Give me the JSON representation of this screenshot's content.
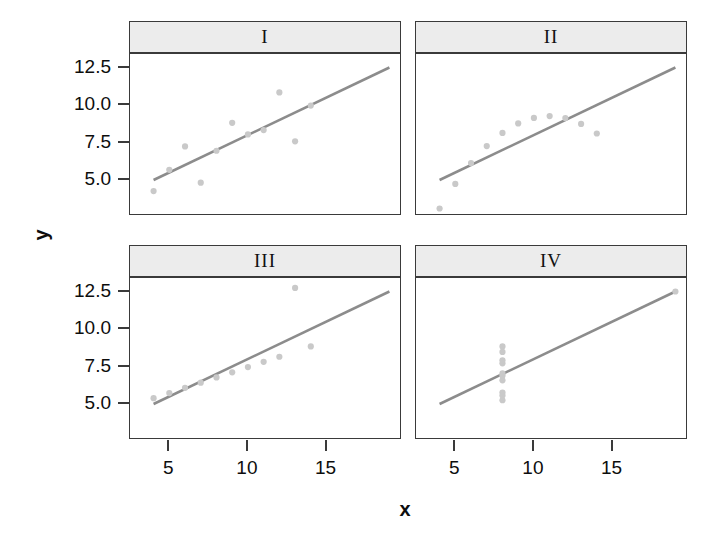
{
  "figure": {
    "width": 720,
    "height": 550,
    "background": "#ffffff",
    "xlabel": "x",
    "ylabel": "y",
    "point_color": "#c9c9c9",
    "line_color": "#8c8c8c",
    "border_color": "#3a3a3a",
    "strip_color": "#ececec",
    "text_color": "#0d0d0d"
  },
  "chart_data": {
    "type": "scatter",
    "title": "",
    "xlabel": "x",
    "ylabel": "y",
    "grid": false,
    "legend": "none",
    "layout": "2x2 trellis panels",
    "xlim": [
      2.5,
      19.8
    ],
    "ylim": [
      2.6,
      13.4
    ],
    "xticks": [
      5,
      10,
      15
    ],
    "xticklabels": [
      "5",
      "10",
      "15"
    ],
    "yticks": [
      5.0,
      7.5,
      10.0,
      12.5
    ],
    "yticklabels": [
      "5.0",
      "7.5",
      "10.0",
      "12.5"
    ],
    "panels": [
      {
        "label": "I",
        "row": 0,
        "col": 0,
        "x": [
          10,
          8,
          13,
          9,
          11,
          14,
          6,
          4,
          12,
          7,
          5
        ],
        "y": [
          8.04,
          6.95,
          7.58,
          8.81,
          8.33,
          9.96,
          7.24,
          4.26,
          10.84,
          4.82,
          5.68
        ],
        "fit": {
          "intercept": 3.0,
          "slope": 0.5,
          "x0": 4,
          "x1": 19
        }
      },
      {
        "label": "II",
        "row": 0,
        "col": 1,
        "x": [
          10,
          8,
          13,
          9,
          11,
          14,
          6,
          4,
          12,
          7,
          5
        ],
        "y": [
          9.14,
          8.14,
          8.74,
          8.77,
          9.26,
          8.1,
          6.13,
          3.1,
          9.13,
          7.26,
          4.74
        ],
        "fit": {
          "intercept": 3.0,
          "slope": 0.5,
          "x0": 4,
          "x1": 19
        }
      },
      {
        "label": "III",
        "row": 1,
        "col": 0,
        "x": [
          10,
          8,
          13,
          9,
          11,
          14,
          6,
          4,
          12,
          7,
          5
        ],
        "y": [
          7.46,
          6.77,
          12.74,
          7.11,
          7.81,
          8.84,
          6.08,
          5.39,
          8.15,
          6.42,
          5.73
        ],
        "fit": {
          "intercept": 3.0,
          "slope": 0.5,
          "x0": 4,
          "x1": 19
        }
      },
      {
        "label": "IV",
        "row": 1,
        "col": 1,
        "x": [
          8,
          8,
          8,
          8,
          8,
          8,
          8,
          19,
          8,
          8,
          8
        ],
        "y": [
          6.58,
          5.76,
          7.71,
          8.84,
          8.47,
          7.04,
          5.25,
          12.5,
          5.56,
          7.91,
          6.89
        ],
        "fit": {
          "intercept": 3.0,
          "slope": 0.5,
          "x0": 4,
          "x1": 19
        }
      }
    ]
  }
}
